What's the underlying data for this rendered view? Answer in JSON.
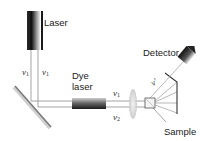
{
  "diagram": {
    "components": {
      "laser": {
        "label": "Laser"
      },
      "dye_laser": {
        "label_line1": "Dye",
        "label_line2": "laser"
      },
      "detector": {
        "label": "Detector"
      },
      "sample": {
        "label": "Sample"
      },
      "mirror": {
        "label": ""
      },
      "lens": {
        "label": ""
      },
      "collector_mirror": {
        "label": ""
      }
    },
    "beams": {
      "laser_left": {
        "symbol": "ν",
        "subscript": "1"
      },
      "laser_right": {
        "symbol": "ν",
        "subscript": "1"
      },
      "to_sample_upper": {
        "symbol": "ν",
        "subscript": "1"
      },
      "to_sample_lower": {
        "symbol": "ν",
        "subscript": "2"
      },
      "scattered": {
        "symbol": "ν′",
        "subscript": ""
      }
    },
    "colors": {
      "tube_dark": "#1a1a1a",
      "tube_light": "#e0e0e0",
      "beam": "#9a9a9a",
      "mirror": "#7a7a7a",
      "lens": "#d8d8d8",
      "text": "#222222"
    }
  }
}
